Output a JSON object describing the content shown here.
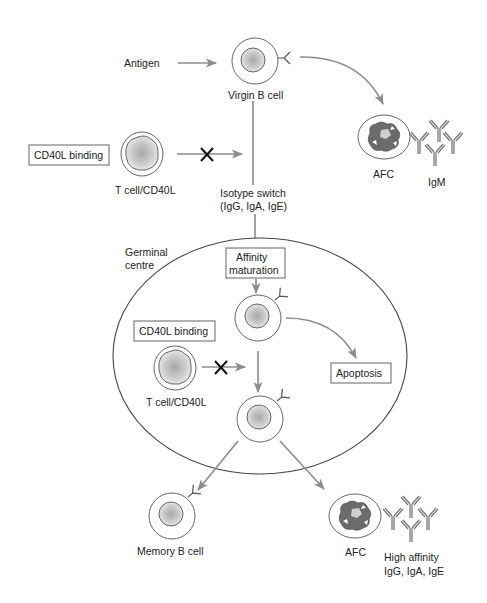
{
  "diagram": {
    "colors": {
      "arrow": "#8c8c8c",
      "outline": "#555555",
      "block_mark": "#111111",
      "nucleus": "#b0b0b0",
      "afc_nucleus": "#6b6b6b"
    },
    "nodes": {
      "antigen": "Antigen",
      "virgin_b_cell": "Virgin B cell",
      "cd40l_binding_top": "CD40L binding",
      "t_cell_top": "T cell/CD40L",
      "isotype_switch_line1": "Isotype switch",
      "isotype_switch_line2": "(IgG, IgA, IgE)",
      "afc_top": "AFC",
      "igm": "IgM",
      "germinal_centre_line1": "Germinal",
      "germinal_centre_line2": "centre",
      "affinity_line1": "Affinity",
      "affinity_line2": "maturation",
      "cd40l_binding_gc": "CD40L binding",
      "t_cell_gc": "T cell/CD40L",
      "apoptosis": "Apoptosis",
      "memory_b_cell": "Memory B cell",
      "afc_bottom": "AFC",
      "high_affinity_line1": "High affinity",
      "high_affinity_line2": "IgG, IgA, IgE"
    },
    "edges": [
      {
        "from": "antigen",
        "to": "virgin_b_cell",
        "type": "arrow"
      },
      {
        "from": "virgin_b_cell",
        "to": "afc_top",
        "type": "curved-arrow"
      },
      {
        "from": "t_cell_top",
        "to": "isotype_switch",
        "type": "blocked-arrow"
      },
      {
        "from": "virgin_b_cell",
        "to": "affinity_maturation",
        "type": "line"
      },
      {
        "from": "affinity_maturation",
        "to": "gc_b_cell_1",
        "type": "arrow"
      },
      {
        "from": "gc_b_cell_1",
        "to": "apoptosis",
        "type": "curved-arrow"
      },
      {
        "from": "gc_b_cell_1",
        "to": "gc_b_cell_2",
        "type": "arrow"
      },
      {
        "from": "t_cell_gc",
        "to": "gc_b_cell_path",
        "type": "blocked-arrow"
      },
      {
        "from": "gc_b_cell_2",
        "to": "memory_b_cell",
        "type": "arrow"
      },
      {
        "from": "gc_b_cell_2",
        "to": "afc_bottom",
        "type": "arrow"
      }
    ]
  }
}
